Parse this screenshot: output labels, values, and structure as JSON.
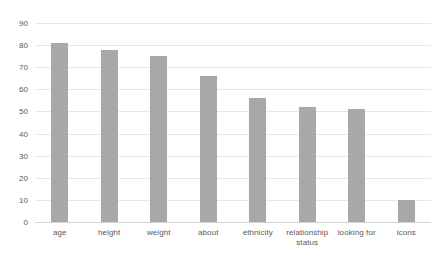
{
  "chart_data": {
    "type": "bar",
    "title": "",
    "subtitle": "",
    "xlabel": "",
    "ylabel": "",
    "ylim": [
      0,
      90
    ],
    "y_ticks": [
      0,
      10,
      20,
      30,
      40,
      50,
      60,
      70,
      80,
      90
    ],
    "grid": true,
    "legend": false,
    "legend_position": "none",
    "bar_color": "#a8a8a8",
    "gridline_color": "#e8e8e8",
    "axis_label_color": "#595959",
    "categories": [
      "age",
      "height",
      "weight",
      "about",
      "relationship status",
      "ethnicity",
      "looking for",
      "icons"
    ],
    "category_labels": [
      {
        "line1": "age",
        "line2": ""
      },
      {
        "line1": "height",
        "line2": ""
      },
      {
        "line1": "weight",
        "line2": ""
      },
      {
        "line1": "about",
        "line2": ""
      },
      {
        "line1": "ethnicity",
        "line2": ""
      },
      {
        "line1": "relationship",
        "line2": "status"
      },
      {
        "line1": "looking for",
        "line2": ""
      },
      {
        "line1": "icons",
        "line2": ""
      }
    ],
    "series": [
      {
        "name": "",
        "values": [
          81,
          78,
          75,
          66,
          56,
          52,
          51,
          10
        ]
      }
    ],
    "values": [
      81,
      78,
      75,
      66,
      56,
      52,
      51,
      10
    ]
  }
}
